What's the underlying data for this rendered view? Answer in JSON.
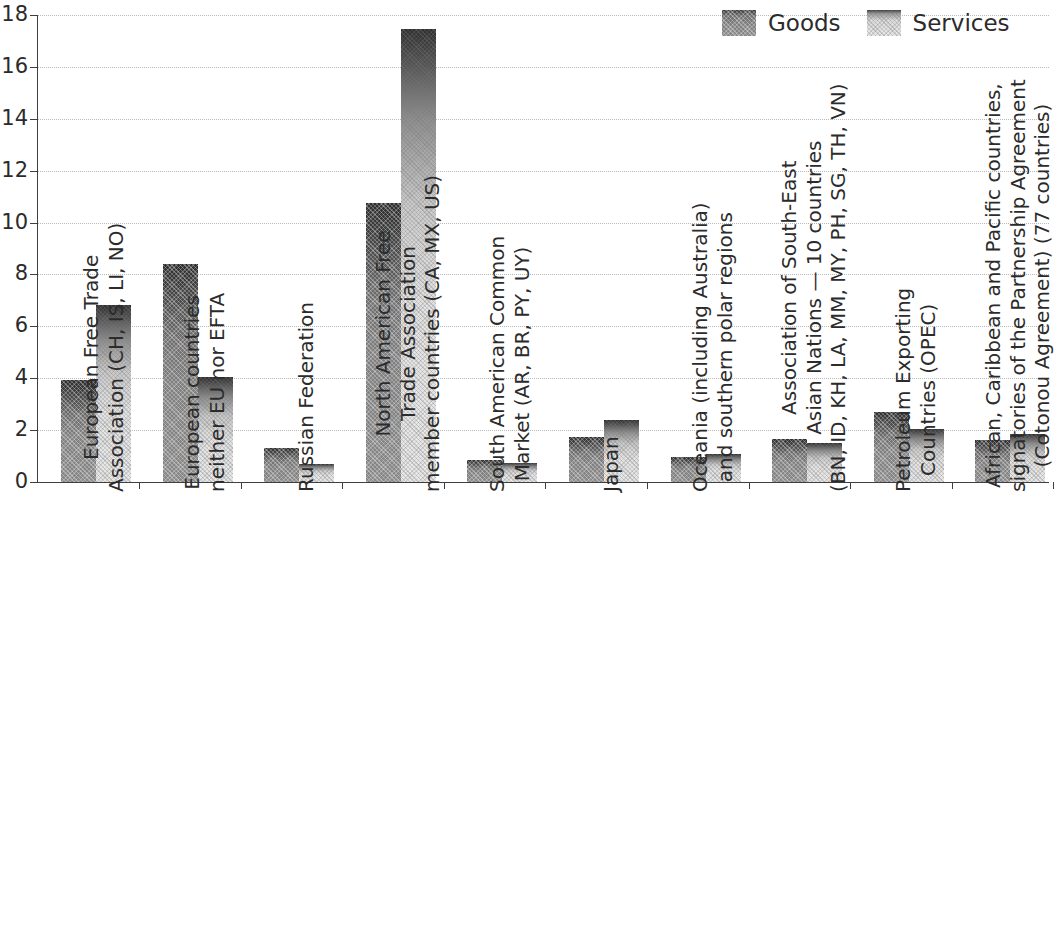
{
  "chart_data": {
    "type": "bar",
    "title": "",
    "subtitle": "",
    "xlabel": "",
    "ylabel": "",
    "ylim": [
      0,
      18
    ],
    "yticks": [
      0,
      2,
      4,
      6,
      8,
      10,
      12,
      14,
      16,
      18
    ],
    "ytick_labels": [
      "0",
      "2",
      "4",
      "6",
      "8",
      "10",
      "12",
      "14",
      "16",
      "18"
    ],
    "grid": "horizontal-dotted",
    "legend_position": "top-right",
    "categories": [
      "European Free Trade Association (CH, IS, LI, NO)",
      "European countries neither EU nor EFTA",
      "Russian Federation",
      "North American Free Trade Association member countries (CA, MX, US)",
      "South American Common Market (AR, BR, PY, UY)",
      "Japan",
      "Oceania (including Australia) and southern polar regions",
      "Association of South-East Asian Nations — 10 countries (BN, ID, KH, LA, MM, MY, PH, SG, TH, VN)",
      "Petroleum Exporting Countries (OPEC)",
      "African, Caribbean and Pacific countries, signatories of the Partnership Agreement (Cotonou Agreement) (77 countries)"
    ],
    "category_label_lines": [
      [
        "European Free Trade",
        "Association (CH, IS, LI, NO)"
      ],
      [
        "European countries",
        "neither EU nor EFTA"
      ],
      [
        "Russian Federation"
      ],
      [
        "North American Free",
        "Trade Association",
        "member countries (CA, MX, US)"
      ],
      [
        "South American Common",
        "Market (AR, BR, PY, UY)"
      ],
      [
        "Japan"
      ],
      [
        "Oceania (including Australia)",
        "and southern polar regions"
      ],
      [
        "Association of South-East",
        "Asian Nations — 10 countries",
        "(BN, ID, KH, LA, MM, MY, PH, SG, TH, VN)"
      ],
      [
        "Petroleum Exporting",
        "Countries (OPEC)"
      ],
      [
        "African, Caribbean and Pacific countries,",
        "signatories of the Partnership Agreement",
        "(Cotonou Agreement) (77 countries)"
      ]
    ],
    "series": [
      {
        "name": "Goods",
        "color": "#7a7a7a",
        "values": [
          3.93,
          8.42,
          1.31,
          10.75,
          0.85,
          1.75,
          0.96,
          1.66,
          2.7,
          1.62
        ]
      },
      {
        "name": "Services",
        "color": "#e3e3e3",
        "values": [
          6.82,
          4.05,
          0.7,
          17.45,
          0.75,
          2.4,
          1.08,
          1.5,
          2.05,
          1.85
        ]
      }
    ]
  },
  "legend": {
    "entries": [
      {
        "label": "Goods",
        "swatch": "goods"
      },
      {
        "label": "Services",
        "swatch": "services"
      }
    ]
  },
  "colors": {
    "axis": "#3f3f3f",
    "grid": "#b9b9b9",
    "text": "#2b2b2b",
    "goods": "#7a7a7a",
    "services": "#e3e3e3",
    "background": "#ffffff"
  }
}
